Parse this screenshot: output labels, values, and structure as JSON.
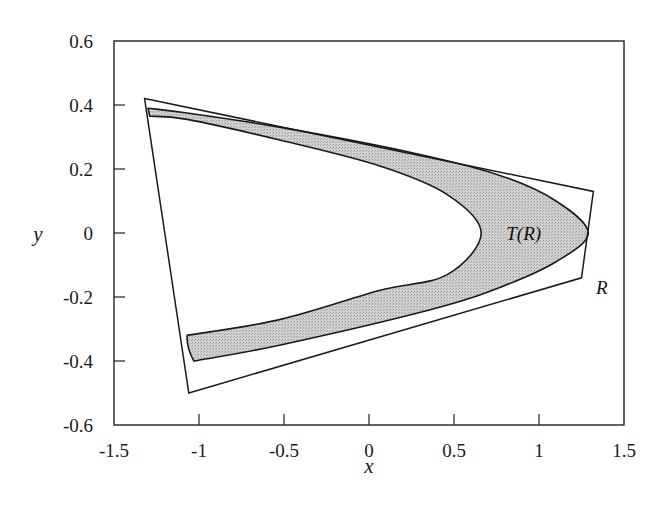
{
  "chart_data": {
    "type": "line",
    "title": "",
    "xlabel": "x",
    "ylabel": "y",
    "xlim": [
      -1.5,
      1.5
    ],
    "ylim": [
      -0.6,
      0.6
    ],
    "grid": false,
    "legend": null,
    "xticks": [
      -1.5,
      -1,
      -0.5,
      0,
      0.5,
      1,
      1.5
    ],
    "xtick_labels": [
      "-1.5",
      "-1",
      "-0.5",
      "0",
      "0.5",
      "1",
      "1.5"
    ],
    "yticks": [
      0.6,
      0.4,
      0.2,
      0,
      -0.2,
      -0.4,
      -0.6
    ],
    "ytick_labels": [
      "0.6",
      "0.4",
      "0.2",
      "0",
      "-0.2",
      "-0.4",
      "-0.6"
    ],
    "annotations": [
      {
        "text": "T(R)",
        "x": 0.91,
        "y": 0.0
      },
      {
        "text": "R",
        "x": 1.37,
        "y": -0.17
      }
    ],
    "series": [
      {
        "name": "R",
        "kind": "polygon",
        "fill": "none",
        "points": [
          [
            -1.32,
            0.42
          ],
          [
            1.32,
            0.13
          ],
          [
            1.25,
            -0.14
          ],
          [
            -1.06,
            -0.5
          ]
        ]
      },
      {
        "name": "T(R)",
        "kind": "filled-region",
        "fill": "#c8c8c8",
        "outer_boundary": [
          [
            -1.3,
            0.39
          ],
          [
            -1.07,
            0.375
          ],
          [
            -0.52,
            0.33
          ],
          [
            0.26,
            0.25
          ],
          [
            0.77,
            0.18
          ],
          [
            1.1,
            0.1
          ],
          [
            1.29,
            0.0
          ],
          [
            1.1,
            -0.09
          ],
          [
            0.77,
            -0.17
          ],
          [
            0.36,
            -0.24
          ],
          [
            -0.52,
            -0.35
          ],
          [
            -1.03,
            -0.4
          ]
        ],
        "inner_boundary": [
          [
            -1.29,
            0.365
          ],
          [
            -1.07,
            0.355
          ],
          [
            -0.52,
            0.29
          ],
          [
            0.06,
            0.21
          ],
          [
            0.46,
            0.12
          ],
          [
            0.66,
            0.0
          ],
          [
            0.46,
            -0.13
          ],
          [
            0.06,
            -0.18
          ],
          [
            -0.52,
            -0.27
          ],
          [
            -1.07,
            -0.32
          ]
        ]
      }
    ]
  },
  "labels": {
    "x_axis": "x",
    "y_axis": "y",
    "region_T": "T(R)",
    "region_R": "R"
  }
}
